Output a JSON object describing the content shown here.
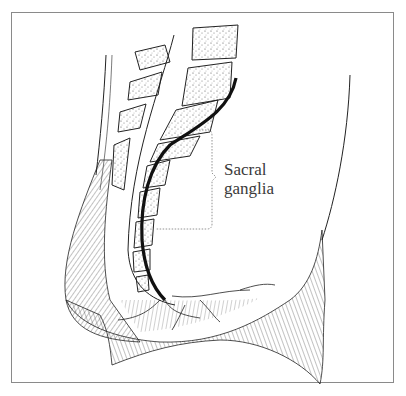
{
  "figure": {
    "type": "anatomical-illustration",
    "label": {
      "line1": "Sacral",
      "line2": "ganglia"
    },
    "colors": {
      "line": "#1a1a1a",
      "border": "#8a8a8a",
      "text": "#3a3a3a",
      "background": "#ffffff"
    }
  }
}
